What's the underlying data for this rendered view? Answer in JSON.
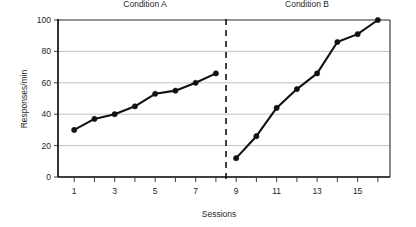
{
  "chart_data": {
    "type": "line",
    "title": "",
    "xlabel": "Sessions",
    "ylabel": "Responses/min",
    "xlim": [
      0.2,
      16.6
    ],
    "ylim": [
      0,
      100
    ],
    "grid": true,
    "legend_position": "none",
    "x_tick_labels": [
      "1",
      "3",
      "5",
      "7",
      "9",
      "11",
      "13",
      "15"
    ],
    "x_tick_values": [
      1,
      3,
      5,
      7,
      9,
      11,
      13,
      15
    ],
    "x_minor_tick_values": [
      1,
      2,
      3,
      4,
      5,
      6,
      7,
      8,
      9,
      10,
      11,
      12,
      13,
      14,
      15,
      16
    ],
    "y_tick_labels": [
      "0",
      "20",
      "40",
      "60",
      "80",
      "100"
    ],
    "y_tick_values": [
      0,
      20,
      40,
      60,
      80,
      100
    ],
    "annotations": [
      {
        "name": "condition-a-label",
        "text": "Condition A",
        "x": 4.5,
        "y": 108
      },
      {
        "name": "condition-b-label",
        "text": "Condition B",
        "x": 12.5,
        "y": 108
      },
      {
        "name": "phase-change-line",
        "type": "vertical-dashed",
        "x": 8.5
      }
    ],
    "series": [
      {
        "name": "Condition A",
        "x": [
          1,
          2,
          3,
          4,
          5,
          6,
          7,
          8
        ],
        "values": [
          30,
          37,
          40,
          45,
          53,
          55,
          60,
          66
        ],
        "color": "#111111",
        "marker": "circle"
      },
      {
        "name": "Condition B",
        "x": [
          9,
          10,
          11,
          12,
          13,
          14,
          15,
          16
        ],
        "values": [
          12,
          26,
          44,
          56,
          66,
          86,
          91,
          100
        ],
        "color": "#111111",
        "marker": "circle"
      }
    ]
  }
}
